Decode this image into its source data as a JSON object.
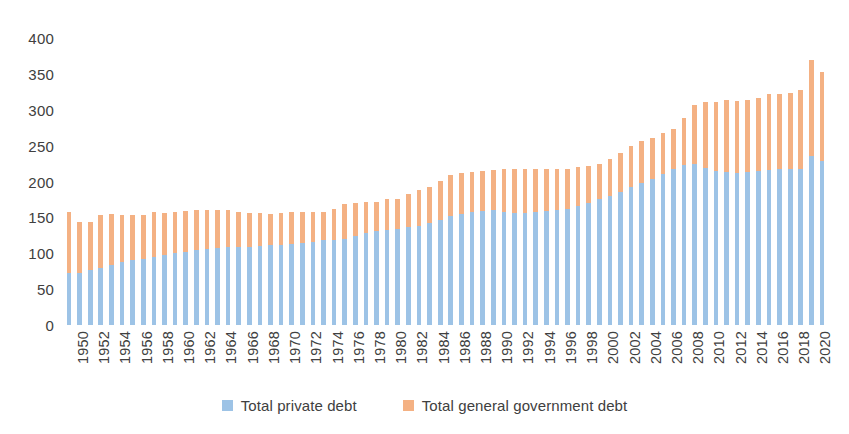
{
  "chart_data": {
    "type": "bar",
    "stacked": true,
    "title": "",
    "subtitle": "",
    "xlabel": "",
    "ylabel": "",
    "ylim": [
      0,
      400
    ],
    "ytick_step": 50,
    "yticks": [
      0,
      50,
      100,
      150,
      200,
      250,
      300,
      350,
      400
    ],
    "grid": false,
    "legend_position": "bottom",
    "xtick_step": 2,
    "xtick_labels": [
      "1950",
      "1952",
      "1954",
      "1956",
      "1958",
      "1960",
      "1962",
      "1964",
      "1966",
      "1968",
      "1970",
      "1972",
      "1974",
      "1976",
      "1978",
      "1980",
      "1982",
      "1984",
      "1986",
      "1988",
      "1990",
      "1992",
      "1994",
      "1996",
      "1998",
      "2000",
      "2002",
      "2004",
      "2006",
      "2008",
      "2010",
      "2012",
      "2014",
      "2016",
      "2018",
      "2020"
    ],
    "categories": [
      "1950",
      "1951",
      "1952",
      "1953",
      "1954",
      "1955",
      "1956",
      "1957",
      "1958",
      "1959",
      "1960",
      "1961",
      "1962",
      "1963",
      "1964",
      "1965",
      "1966",
      "1967",
      "1968",
      "1969",
      "1970",
      "1971",
      "1972",
      "1973",
      "1974",
      "1975",
      "1976",
      "1977",
      "1978",
      "1979",
      "1980",
      "1981",
      "1982",
      "1983",
      "1984",
      "1985",
      "1986",
      "1987",
      "1988",
      "1989",
      "1990",
      "1991",
      "1992",
      "1993",
      "1994",
      "1995",
      "1996",
      "1997",
      "1998",
      "1999",
      "2000",
      "2001",
      "2002",
      "2003",
      "2004",
      "2005",
      "2006",
      "2007",
      "2008",
      "2009",
      "2010",
      "2011",
      "2012",
      "2013",
      "2014",
      "2015",
      "2016",
      "2017",
      "2018",
      "2019",
      "2020",
      "2021"
    ],
    "series": [
      {
        "name": "Total private debt",
        "color": "#9dc3e6",
        "values": [
          72,
          73,
          76,
          80,
          84,
          88,
          90,
          92,
          95,
          98,
          100,
          102,
          104,
          106,
          108,
          109,
          109,
          109,
          110,
          111,
          112,
          113,
          115,
          116,
          118,
          118,
          120,
          124,
          128,
          131,
          133,
          134,
          136,
          138,
          142,
          147,
          152,
          155,
          157,
          159,
          160,
          158,
          156,
          156,
          157,
          159,
          160,
          162,
          166,
          170,
          175,
          180,
          185,
          192,
          198,
          204,
          211,
          218,
          223,
          224,
          219,
          214,
          213,
          212,
          213,
          214,
          216,
          217,
          217,
          218,
          236,
          228
        ]
      },
      {
        "name": "Total general government debt",
        "color": "#f4b183",
        "values": [
          86,
          70,
          67,
          73,
          71,
          65,
          63,
          61,
          63,
          58,
          58,
          57,
          57,
          55,
          53,
          51,
          48,
          47,
          46,
          44,
          44,
          44,
          43,
          41,
          40,
          44,
          48,
          46,
          44,
          41,
          42,
          42,
          46,
          50,
          50,
          54,
          57,
          57,
          56,
          55,
          56,
          60,
          62,
          62,
          60,
          59,
          58,
          56,
          54,
          52,
          50,
          51,
          55,
          58,
          58,
          57,
          56,
          55,
          66,
          82,
          92,
          97,
          100,
          100,
          101,
          102,
          106,
          105,
          106,
          109,
          134,
          124
        ]
      }
    ],
    "totals": [
      158,
      143,
      143,
      153,
      155,
      153,
      153,
      153,
      158,
      156,
      158,
      159,
      161,
      161,
      161,
      160,
      157,
      156,
      156,
      155,
      156,
      157,
      158,
      157,
      158,
      162,
      168,
      170,
      172,
      172,
      175,
      176,
      182,
      188,
      192,
      201,
      209,
      212,
      213,
      214,
      216,
      218,
      218,
      218,
      217,
      218,
      218,
      218,
      220,
      222,
      225,
      231,
      240,
      250,
      256,
      261,
      267,
      273,
      289,
      306,
      311,
      311,
      313,
      312,
      314,
      316,
      322,
      322,
      323,
      327,
      370,
      352
    ],
    "colors": {
      "private": "#9dc3e6",
      "government": "#f4b183",
      "text": "#404040",
      "background": "#ffffff"
    }
  },
  "legend": {
    "entries": [
      {
        "label": "Total private debt",
        "color": "#9dc3e6"
      },
      {
        "label": "Total general government debt",
        "color": "#f4b183"
      }
    ]
  }
}
